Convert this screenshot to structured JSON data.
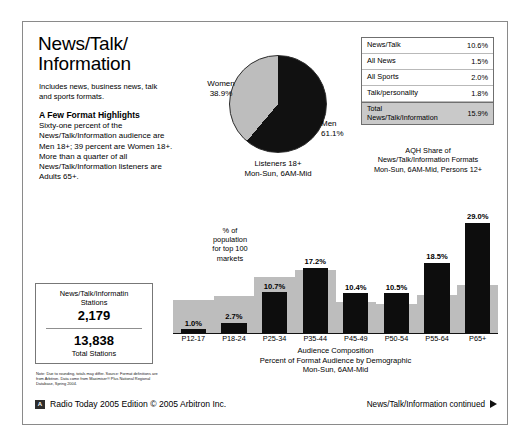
{
  "header": {
    "title": "News/Talk/\nInformation",
    "intro": "Includes news, business news, talk and sports formats.",
    "highlights_heading": "A Few Format Highlights",
    "highlights_body": "Sixty-one percent of the News/Talk/Information audience are Men 18+; 39 percent are Women 18+. More than a quarter of all News/Talk/Information listeners are Adults 65+."
  },
  "pie": {
    "caption": "Listeners 18+\nMon-Sun, 6AM-Mid",
    "women_label": "Women\n38.9%",
    "men_label": "Men\n61.1%"
  },
  "aqh_table": {
    "rows": [
      {
        "label": "News/Talk",
        "value": "10.6%"
      },
      {
        "label": "All News",
        "value": "1.5%"
      },
      {
        "label": "All Sports",
        "value": "2.0%"
      },
      {
        "label": "Talk/personality",
        "value": "1.8%"
      }
    ],
    "total": {
      "label": "Total\nNews/Talk/Information",
      "value": "15.9%"
    },
    "caption": "AQH Share of\nNews/Talk/Information Formats\nMon-Sun, 6AM-Mid, Persons 12+"
  },
  "stations": {
    "format_label": "News/Talk/Informatin\nStations",
    "format_count": "2,179",
    "total_count": "13,838",
    "total_label": "Total Stations"
  },
  "footnote": "Note:  Due to rounding, totals may differ.\nSource:  Format definitions are from Arbitron. Data come from Maximiser® Plus National Regional Database, Spring 2004.",
  "footer": {
    "logo": "A",
    "left": "Radio Today 2005 Edition   © 2005 Arbitron Inc.",
    "right": "News/Talk/Information continued"
  },
  "chart_data": {
    "type": "bar",
    "title": "Audience Composition",
    "subtitle": "Percent of Format Audience by Demographic\nMon-Sun, 6AM-Mid",
    "caption": "Audience Composition\nPercent of Format Audience by Demographic\nMon-Sun, 6AM-Mid",
    "xlabel": "",
    "ylabel": "",
    "ylim": [
      0,
      31
    ],
    "grid": false,
    "legend_position": "inline",
    "categories": [
      "P12-17",
      "P18-24",
      "P25-34",
      "P35-44",
      "P45-49",
      "P50-54",
      "P55-64",
      "P65+"
    ],
    "series": [
      {
        "name": "Percent of format audience",
        "color": "#0d0d0d",
        "values": [
          1.0,
          2.7,
          10.7,
          17.2,
          10.4,
          10.5,
          18.5,
          29.0
        ],
        "labels": [
          "1.0%",
          "2.7%",
          "10.7%",
          "17.2%",
          "10.4%",
          "10.5%",
          "18.5%",
          "29.0%"
        ]
      },
      {
        "name": "% of population for top 100 markets",
        "color": "#bdbdbd",
        "values": [
          8.8,
          9.6,
          14.6,
          16.6,
          8.1,
          7.6,
          9.9,
          12.6
        ]
      }
    ],
    "population_note": "% of\npopulation\nfor top 100\nmarkets"
  }
}
